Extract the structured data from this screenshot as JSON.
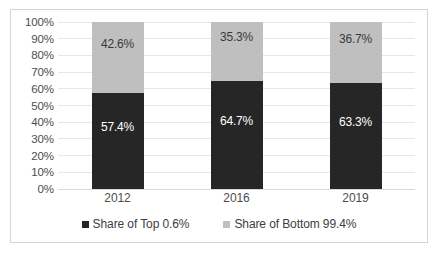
{
  "chart_data": {
    "type": "bar",
    "stacked": true,
    "normalized_100pct": true,
    "title": "",
    "subtitle": "",
    "xlabel": "",
    "ylabel": "",
    "categories": [
      "2012",
      "2016",
      "2019"
    ],
    "series": [
      {
        "name": "Share of Top 0.6%",
        "color": "#262626",
        "values": [
          57.4,
          64.7,
          63.3
        ],
        "value_labels": [
          "57.4%",
          "64.7%",
          "63.3%"
        ]
      },
      {
        "name": "Share of Bottom 99.4%",
        "color": "#bfbfbf",
        "values": [
          42.6,
          35.3,
          36.7
        ],
        "value_labels": [
          "42.6%",
          "35.3%",
          "36.7%"
        ]
      }
    ],
    "ylim": [
      0,
      100
    ],
    "ytick_values": [
      0,
      10,
      20,
      30,
      40,
      50,
      60,
      70,
      80,
      90,
      100
    ],
    "ytick_labels": [
      "0%",
      "10%",
      "20%",
      "30%",
      "40%",
      "50%",
      "60%",
      "70%",
      "80%",
      "90%",
      "100%"
    ],
    "grid": true,
    "legend_position": "bottom",
    "legend_entries": [
      "Share of Top 0.6%",
      "Share of Bottom 99.4%"
    ]
  },
  "colors": {
    "series_top": "#262626",
    "series_bottom": "#bfbfbf",
    "gridline": "#e6e6e6",
    "border": "#d4d4d4",
    "axis_text": "#4d4d4d",
    "background": "#ffffff"
  }
}
